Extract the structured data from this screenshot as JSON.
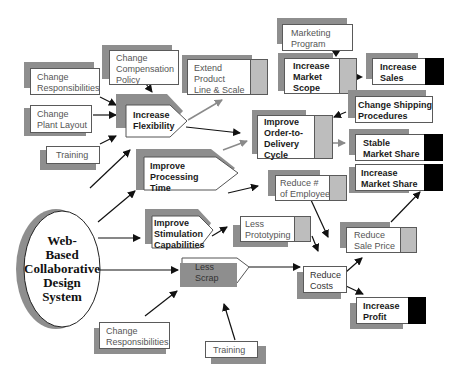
{
  "diagram": {
    "center": {
      "label": "Web-\nBased\nCollaborative\nDesign\nSystem"
    },
    "nodes": {
      "change_responsibilities_top": "Change\nResponsibilities",
      "change_plant_layout": "Change\nPlant Layout",
      "training_left": "Training",
      "change_compensation_policy": "Change\nCompensation\nPolicy",
      "increase_flexibility": "Increase\nFlexibility",
      "extend_product_line": "Extend\nProduct\nLine & Scale",
      "marketing_program": "Marketing\nProgram",
      "increase_market_scope": "Increase\nMarket\nScope",
      "increase_sales": "Increase\nSales",
      "change_shipping_procedures": "Change Shipping\nProcedures",
      "improve_order_to_delivery": "Improve\nOrder-to-\nDelivery\nCycle",
      "stable_market_share": "Stable\nMarket Share",
      "improve_processing_time": "Improve\nProcessing\nTime",
      "reduce_employees": "Reduce #\nof Employees",
      "increase_market_share": "Increase\nMarket Share",
      "improve_stimulation": "Improve\nStimulation\nCapabilities",
      "less_prototyping": "Less\nPrototyping",
      "reduce_sale_price": "Reduce\nSale Price",
      "less_scrap": "Less\nScrap",
      "reduce_costs": "Reduce\nCosts",
      "increase_profit": "Increase\nProfit",
      "change_responsibilities_bottom": "Change\nResponsibilities",
      "training_bottom": "Training"
    },
    "colors": {
      "shadow": "#8e8e8e",
      "tab": "#bdbdbd",
      "outcome_tab": "#000000",
      "arrow": "#111111",
      "gray_arrow": "#8a8a8a"
    }
  }
}
